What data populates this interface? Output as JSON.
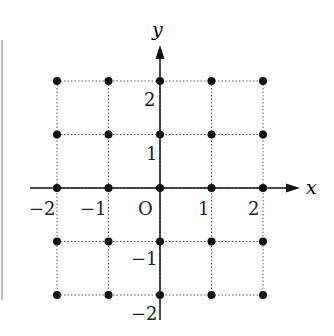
{
  "diagram": {
    "type": "lattice_points_coordinate_plane",
    "axes": {
      "x_label": "x",
      "y_label": "y",
      "origin_label": "O"
    },
    "x_ticks": [
      "−2",
      "−1",
      "1",
      "2"
    ],
    "y_ticks": [
      "2",
      "1",
      "−1",
      "−2"
    ],
    "grid_range": {
      "x": [
        -2,
        2
      ],
      "y": [
        -2,
        2
      ]
    },
    "points_note": "all 25 integer lattice points with |x|≤2, |y|≤2"
  },
  "chart_data": {
    "type": "scatter",
    "title": "",
    "xlabel": "x",
    "ylabel": "y",
    "xlim": [
      -2,
      2
    ],
    "ylim": [
      -2,
      2
    ],
    "grid": true,
    "points": [
      [
        -2,
        2
      ],
      [
        -1,
        2
      ],
      [
        0,
        2
      ],
      [
        1,
        2
      ],
      [
        2,
        2
      ],
      [
        -2,
        1
      ],
      [
        -1,
        1
      ],
      [
        0,
        1
      ],
      [
        1,
        1
      ],
      [
        2,
        1
      ],
      [
        -2,
        0
      ],
      [
        -1,
        0
      ],
      [
        0,
        0
      ],
      [
        1,
        0
      ],
      [
        2,
        0
      ],
      [
        -2,
        -1
      ],
      [
        -1,
        -1
      ],
      [
        0,
        -1
      ],
      [
        1,
        -1
      ],
      [
        2,
        -1
      ],
      [
        -2,
        -2
      ],
      [
        -1,
        -2
      ],
      [
        0,
        -2
      ],
      [
        1,
        -2
      ],
      [
        2,
        -2
      ]
    ]
  }
}
